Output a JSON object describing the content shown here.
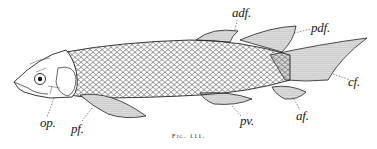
{
  "figure": {
    "caption": "Fig. 111.",
    "colors": {
      "ink": "#222222",
      "paper": "#ffffff"
    },
    "labels": {
      "op": "op.",
      "pf": "pf.",
      "pv": "pv.",
      "af": "af.",
      "cf": "cf.",
      "pdf": "pdf.",
      "adf": "adf."
    }
  }
}
